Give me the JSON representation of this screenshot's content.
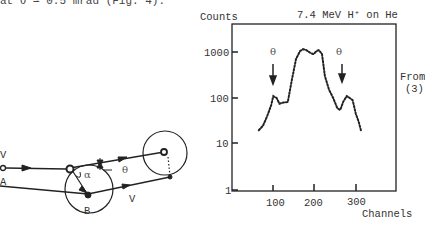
{
  "text": {
    "top_line": "at θ ≃ 0.5 mrad (Fig. 4).",
    "credit_line1": "From",
    "credit_line2": "(3)"
  },
  "diagram": {
    "labels": {
      "v_in": "V",
      "point_a": "A",
      "point_b": "B",
      "v_out": "V",
      "alpha": "α",
      "theta": "θ"
    }
  },
  "chart_data": {
    "type": "line",
    "title": "7.4 MeV  H⁺ on He",
    "xlabel": "Channels",
    "ylabel": "Counts",
    "yscale": "log",
    "ylim": [
      1,
      3000
    ],
    "xlim": [
      0,
      370
    ],
    "y_ticks": [
      "1",
      "10",
      "100",
      "1000"
    ],
    "x_ticks": [
      "100",
      "200",
      "300"
    ],
    "annotations": [
      {
        "text": "θ",
        "x": 100,
        "arrow_down": true
      },
      {
        "text": "θ",
        "x": 265,
        "arrow_down": true
      }
    ],
    "series": [
      {
        "name": "spectrum",
        "style": "dotted",
        "x": [
          65,
          75,
          85,
          95,
          100,
          108,
          115,
          125,
          135,
          145,
          155,
          165,
          172,
          180,
          190,
          197,
          205,
          210,
          218,
          225,
          235,
          245,
          255,
          262,
          270,
          278,
          285,
          292,
          300,
          307,
          312
        ],
        "y": [
          20,
          25,
          40,
          70,
          110,
          100,
          75,
          80,
          82,
          250,
          700,
          1050,
          1150,
          1100,
          950,
          900,
          1050,
          1100,
          900,
          300,
          150,
          100,
          60,
          55,
          85,
          110,
          100,
          90,
          45,
          30,
          20
        ]
      }
    ],
    "grid": false
  }
}
